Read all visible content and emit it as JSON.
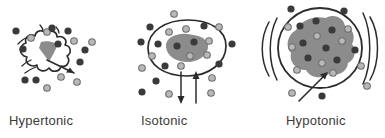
{
  "figure": {
    "background_color": "#ffffff",
    "palette": {
      "outline": "#2b2b2b",
      "cytoplasm_fill": "#8c8c8c",
      "solute_dark": "#3a3a3a",
      "solute_light": "#b8b8b8",
      "solute_light_ring": "#6e6e6e",
      "caption_color": "#3b3b3b",
      "arrow_color": "#2b2b2b"
    }
  },
  "panels": [
    {
      "id": "hypertonic",
      "caption": "Hypertonic",
      "cell_state": "shriveled",
      "cell_description": "crenated cell with irregular wavy membrane and small shrunken dark cytoplasm",
      "water_direction": "out",
      "arrow": {
        "name": "water-out-arrow",
        "direction": "out",
        "label": ""
      },
      "solutes": {
        "outside_count": 14,
        "inside_count": 2,
        "dark_count": 8,
        "light_count": 8
      }
    },
    {
      "id": "isotonic",
      "caption": "Isotonic",
      "cell_state": "normal",
      "cell_description": "rounded cell with smooth membrane and medium grey cytoplasm",
      "water_direction": "equal",
      "arrow": {
        "name": "water-balanced-arrows",
        "direction": "both",
        "label": ""
      },
      "solutes": {
        "outside_count": 18,
        "inside_count": 4,
        "dark_count": 12,
        "light_count": 10
      }
    },
    {
      "id": "hypotonic",
      "caption": "Hypotonic",
      "cell_state": "swollen",
      "cell_description": "swollen cell nearly filling the circular membrane with motion arcs",
      "water_direction": "in",
      "arrow": {
        "name": "water-in-arrow",
        "direction": "in",
        "label": ""
      },
      "solutes": {
        "outside_count": 7,
        "inside_count": 13,
        "dark_count": 11,
        "light_count": 9
      }
    }
  ]
}
